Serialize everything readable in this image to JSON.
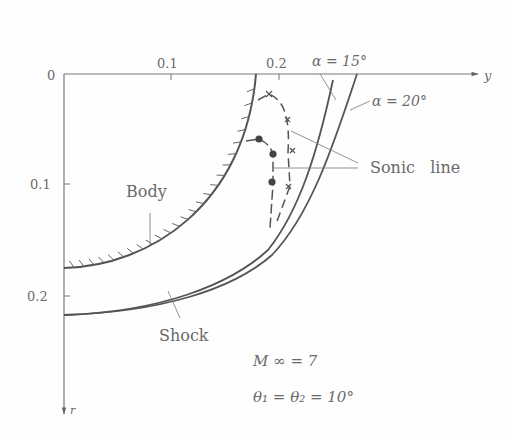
{
  "diagram": {
    "axes": {
      "horizontal_label": "y",
      "vertical_label": "r",
      "origin_label": "0",
      "h_ticks": [
        "0.1",
        "0.2"
      ],
      "v_ticks": [
        "0.1",
        "0.2"
      ]
    },
    "labels": {
      "body": "Body",
      "shock": "Shock",
      "sonic_line": "Sonic   line",
      "alpha15": "α = 15°",
      "alpha20": "α = 20°"
    },
    "conditions": {
      "mach": "M ∞ = 7",
      "theta": "θ₁  = θ₂ = 10°"
    },
    "colors": {
      "ink": "#555555",
      "text": "#6a6a6a"
    }
  }
}
